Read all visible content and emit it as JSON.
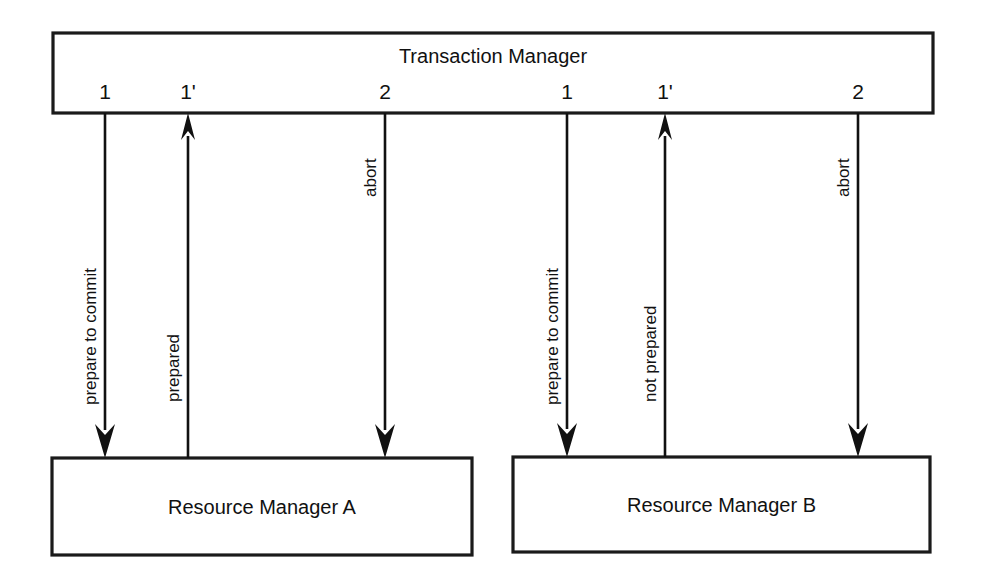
{
  "diagram": {
    "type": "sequence-diagram",
    "background_color": "#ffffff",
    "line_color": "#111111",
    "nodes": {
      "coordinator": {
        "label": "Transaction Manager",
        "x": 53,
        "y": 33,
        "width": 880,
        "height": 80
      },
      "participant_a": {
        "label": "Resource Manager A",
        "x": 52,
        "y": 458,
        "width": 420,
        "height": 97
      },
      "participant_b": {
        "label": "Resource Manager B",
        "x": 513,
        "y": 457,
        "width": 417,
        "height": 95
      }
    },
    "ports": [
      {
        "label": "1",
        "x": 105,
        "y": 99
      },
      {
        "label": "1'",
        "x": 188,
        "y": 99
      },
      {
        "label": "2",
        "x": 385,
        "y": 99
      },
      {
        "label": "1",
        "x": 567,
        "y": 99
      },
      {
        "label": "1'",
        "x": 665,
        "y": 99
      },
      {
        "label": "2",
        "x": 858,
        "y": 99
      }
    ],
    "messages": [
      {
        "id": "a-prepare",
        "label": "prepare to commit",
        "from": "coordinator",
        "to": "participant_a",
        "direction": "down",
        "x": 105,
        "y_start": 113,
        "y_end": 458,
        "label_x": 96,
        "label_y_bottom": 405
      },
      {
        "id": "a-prepared",
        "label": "prepared",
        "from": "participant_a",
        "to": "coordinator",
        "direction": "up",
        "x": 188,
        "y_start": 458,
        "y_end": 113,
        "label_x": 179,
        "label_y_bottom": 402
      },
      {
        "id": "a-abort",
        "label": "abort",
        "from": "coordinator",
        "to": "participant_a",
        "direction": "down",
        "x": 385,
        "y_start": 113,
        "y_end": 458,
        "label_x": 376,
        "label_y_bottom": 197
      },
      {
        "id": "b-prepare",
        "label": "prepare to commit",
        "from": "coordinator",
        "to": "participant_b",
        "direction": "down",
        "x": 567,
        "y_start": 113,
        "y_end": 457,
        "label_x": 558,
        "label_y_bottom": 405
      },
      {
        "id": "b-not-prepared",
        "label": "not prepared",
        "from": "participant_b",
        "to": "coordinator",
        "direction": "up",
        "x": 665,
        "y_start": 457,
        "y_end": 113,
        "label_x": 656,
        "label_y_bottom": 402
      },
      {
        "id": "b-abort",
        "label": "abort",
        "from": "coordinator",
        "to": "participant_b",
        "direction": "down",
        "x": 858,
        "y_start": 113,
        "y_end": 457,
        "label_x": 849,
        "label_y_bottom": 197
      }
    ]
  }
}
